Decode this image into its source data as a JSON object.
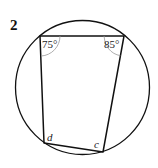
{
  "question_number": "2",
  "diagram": {
    "type": "cyclic-quadrilateral",
    "circle": {
      "cx": 82.5,
      "cy": 87.5,
      "r": 67
    },
    "vertices": {
      "top_left": {
        "x": 40,
        "y": 36
      },
      "top_right": {
        "x": 124,
        "y": 36
      },
      "bottom_right": {
        "x": 103,
        "y": 152
      },
      "bottom_left": {
        "x": 44,
        "y": 143
      }
    },
    "angles": {
      "top_left": "75°",
      "top_right": "85°",
      "bottom_left": "d",
      "bottom_right": "c"
    },
    "stroke_color": "#111111",
    "arc_color": "#999999"
  }
}
